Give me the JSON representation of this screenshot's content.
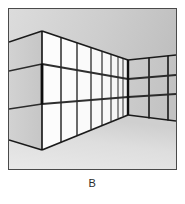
{
  "figure": {
    "caption": "B",
    "alt_title": "One-point perspective interior: long glazed wall receding to far corner",
    "frame": {
      "border_color": "#4a4a4a",
      "width_px": 169,
      "height_px": 162
    },
    "palette": {
      "ceiling_light": "#d9d9d9",
      "ceiling_dark": "#c0c0c0",
      "floor_light": "#e8e8e8",
      "floor_dark": "#d2d2d2",
      "near_side_panel": "#cfcfcf",
      "glass_panel": "#fbfbfb",
      "back_wall_panel": "#c9c9c9",
      "mullion": "#2b2b2b",
      "outline": "#1a1a1a",
      "page_background": "#ffffff",
      "caption_color": "#2a2a2a"
    },
    "geometry": {
      "near_corner_x": 33,
      "near_corner_top_y": 22,
      "near_corner_bottom_y": 141,
      "far_corner_x": 119,
      "far_corner_top_y": 51,
      "far_corner_bottom_y": 106,
      "left_edge_top_y": 33,
      "left_edge_bottom_y": 131,
      "right_edge_top_y": 46,
      "right_edge_bottom_y": 112,
      "horizontal_band_count": 2,
      "long_wall_bay_count": 8,
      "back_wall_columns": 3,
      "back_wall_rows": 3
    },
    "long_wall_mullions_x": [
      33,
      52,
      68,
      82,
      93,
      102,
      109,
      114,
      119
    ],
    "back_wall_columns_x": [
      119,
      140,
      159,
      167
    ],
    "back_wall_rows_y_at_corner": [
      51,
      70,
      88,
      106
    ]
  }
}
